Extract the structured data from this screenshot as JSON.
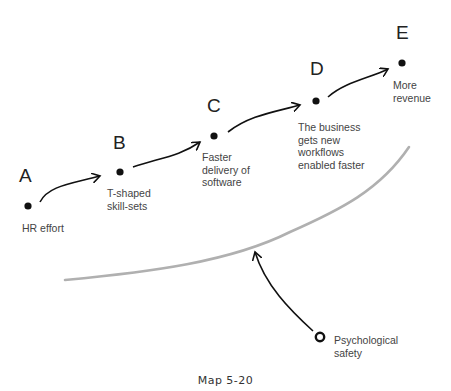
{
  "nodes": [
    {
      "id": "A",
      "letter": "A",
      "label": "HR effort"
    },
    {
      "id": "B",
      "letter": "B",
      "label": "T-shaped\nskill-sets"
    },
    {
      "id": "C",
      "letter": "C",
      "label": "Faster\ndelivery of\nsoftware"
    },
    {
      "id": "D",
      "letter": "D",
      "label": "The business\ngets new\nworkflows\nenabled faster"
    },
    {
      "id": "E",
      "letter": "E",
      "label": "More\nrevenue"
    }
  ],
  "enabler": {
    "label": "Psychological\nsafety"
  },
  "caption": "Map 5-20",
  "colors": {
    "ink": "#111111",
    "boundary": "#b0b0b0",
    "text": "#444444"
  }
}
